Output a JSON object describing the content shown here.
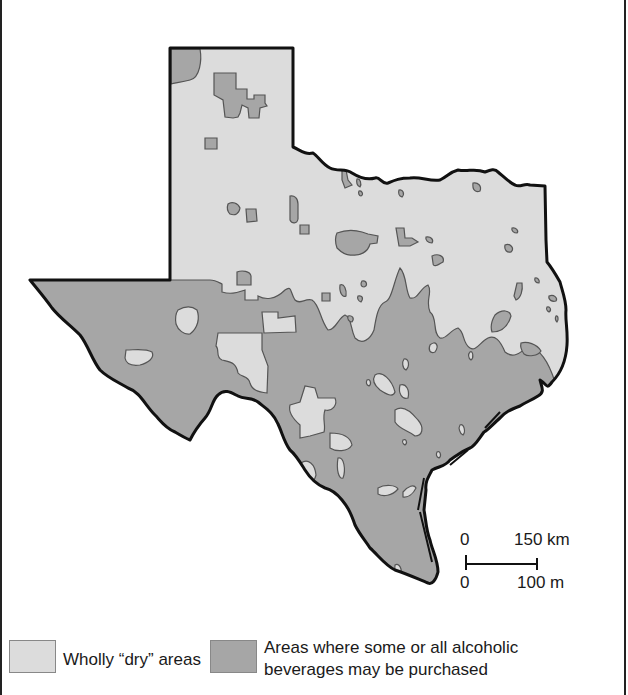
{
  "map": {
    "title": "Texas alcohol availability by county",
    "region": "Texas",
    "colors": {
      "dry": "#dcdcdc",
      "wet": "#a6a6a6",
      "outline": "#111111",
      "inner_outline": "#555555"
    }
  },
  "scale_bar": {
    "km_zero": "0",
    "km_value": "150 km",
    "mi_zero": "0",
    "mi_value": "100 m"
  },
  "legend": {
    "items": [
      {
        "key": "dry",
        "label": "Wholly “dry” areas",
        "color": "#dcdcdc"
      },
      {
        "key": "wet",
        "label_line1": "Areas where some or all alcoholic",
        "label_line2": "beverages may be purchased",
        "color": "#a6a6a6"
      }
    ]
  }
}
